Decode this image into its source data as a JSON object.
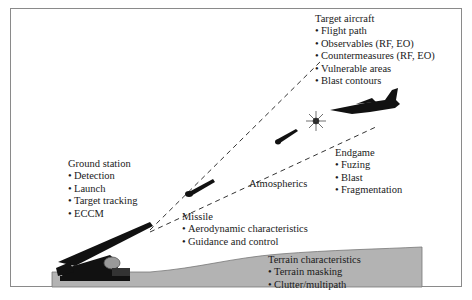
{
  "diagram": {
    "blocks": {
      "target_aircraft": {
        "title": "Target aircraft",
        "items": [
          "Flight path",
          "Observables (RF, EO)",
          "Countermeasures (RF, EO)",
          "Vulnerable areas",
          "Blast contours"
        ]
      },
      "ground_station": {
        "title": "Ground station",
        "items": [
          "Detection",
          "Launch",
          "Target tracking",
          "ECCM"
        ]
      },
      "endgame": {
        "title": "Endgame",
        "items": [
          "Fuzing",
          "Blast",
          "Fragmentation"
        ]
      },
      "missile": {
        "title": "Missile",
        "items": [
          "Aerodynamic characteristics",
          "Guidance and control"
        ]
      },
      "terrain": {
        "title": "Terrain characteristics",
        "items": [
          "Terrain masking",
          "Clutter/multipath"
        ]
      }
    },
    "labels": {
      "atmospherics": "Atmospherics"
    },
    "icons": [
      "launcher-icon",
      "radar-dish-icon",
      "missile-icon",
      "explosion-icon",
      "jet-aircraft-icon"
    ],
    "colors": {
      "terrain_fill": "#b3b3b3",
      "frame_border": "#8a8a8a",
      "silhouette": "#111111"
    }
  }
}
